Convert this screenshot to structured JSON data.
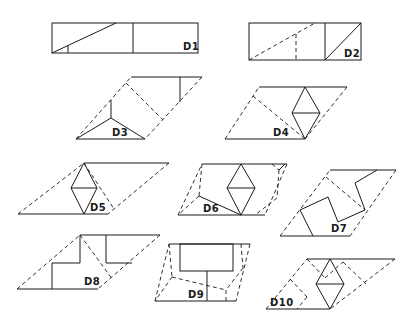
{
  "figure": {
    "stroke_color": "#1a1a1a",
    "background": "#ffffff",
    "line_styles": {
      "solid": "cut/edge",
      "dashed": "construction/fold"
    }
  },
  "panels": [
    {
      "id": "D1",
      "label": "D1",
      "shape": "rectangle"
    },
    {
      "id": "D2",
      "label": "D2",
      "shape": "rectangle"
    },
    {
      "id": "D3",
      "label": "D3",
      "shape": "parallelogram"
    },
    {
      "id": "D4",
      "label": "D4",
      "shape": "parallelogram"
    },
    {
      "id": "D5",
      "label": "D5",
      "shape": "parallelogram"
    },
    {
      "id": "D6",
      "label": "D6",
      "shape": "parallelogram"
    },
    {
      "id": "D7",
      "label": "D7",
      "shape": "parallelogram"
    },
    {
      "id": "D8",
      "label": "D8",
      "shape": "parallelogram"
    },
    {
      "id": "D9",
      "label": "D9",
      "shape": "parallelogram"
    },
    {
      "id": "D10",
      "label": "D10",
      "shape": "parallelogram"
    }
  ]
}
